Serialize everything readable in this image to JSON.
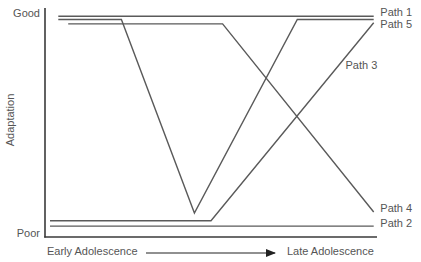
{
  "chart_data": {
    "type": "line",
    "title": "",
    "xlabel_start": "Early Adolescence",
    "xlabel_end": "Late Adolescence",
    "ylabel": "Adaptation",
    "y_tick_labels": {
      "top": "Good",
      "bottom": "Poor"
    },
    "xlim": [
      0,
      10
    ],
    "ylim": [
      0,
      10
    ],
    "grid": false,
    "legend": "direct labels at right end of lines",
    "line_color": "#5a5a5a",
    "series": [
      {
        "name": "Path 1",
        "points": [
          [
            0.4,
            9.9
          ],
          [
            9.9,
            9.9
          ]
        ],
        "label_pos": [
          10.1,
          10.05
        ]
      },
      {
        "name": "Path 5",
        "points": [
          [
            0.4,
            9.75
          ],
          [
            2.3,
            9.75
          ],
          [
            4.5,
            0.95
          ],
          [
            7.6,
            9.75
          ],
          [
            9.9,
            9.75
          ]
        ],
        "label_pos": [
          10.1,
          9.5
        ]
      },
      {
        "name": "Path 4",
        "points": [
          [
            0.7,
            9.55
          ],
          [
            5.35,
            9.55
          ],
          [
            9.9,
            1.0
          ]
        ],
        "label_pos": [
          10.1,
          1.15
        ]
      },
      {
        "name": "Path 3",
        "points": [
          [
            0.15,
            0.6
          ],
          [
            5.0,
            0.6
          ],
          [
            9.9,
            9.6
          ]
        ],
        "label_pos": [
          9.05,
          7.65
        ]
      },
      {
        "name": "Path 2",
        "points": [
          [
            0.15,
            0.36
          ],
          [
            9.9,
            0.36
          ]
        ],
        "label_pos": [
          10.1,
          0.45
        ]
      }
    ]
  },
  "labels": {
    "y_good": "Good",
    "y_poor": "Poor",
    "y_title": "Adaptation",
    "x_early": "Early Adolescence",
    "x_late": "Late Adolescence"
  }
}
